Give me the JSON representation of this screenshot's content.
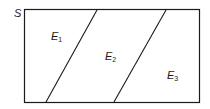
{
  "diagram": {
    "type": "venn-partition",
    "sample_space_label": "S",
    "events": [
      {
        "name": "E",
        "sub": "1"
      },
      {
        "name": "E",
        "sub": "2"
      },
      {
        "name": "E",
        "sub": "3"
      }
    ],
    "colors": {
      "stroke": "#1a1a1a",
      "background": "#ffffff"
    }
  }
}
